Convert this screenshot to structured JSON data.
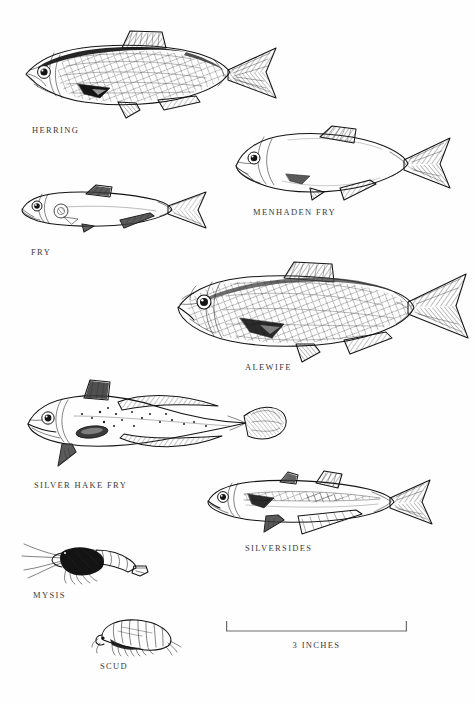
{
  "plate": {
    "title": "Baitfish identification plate",
    "background_color": "#ffffff",
    "ink_color": "#141414",
    "text_color": "#3a3a3a"
  },
  "figures": [
    {
      "id": "herring",
      "label": "HERRING",
      "kind": "fish-illustration",
      "label_x": 32,
      "label_y": 125
    },
    {
      "id": "menhaden-fry",
      "label": "MENHADEN FRY",
      "kind": "fish-illustration",
      "label_x": 253,
      "label_y": 207
    },
    {
      "id": "fry",
      "label": "FRY",
      "kind": "fish-illustration",
      "label_x": 31,
      "label_y": 247
    },
    {
      "id": "alewife",
      "label": "ALEWIFE",
      "kind": "fish-illustration",
      "label_x": 245,
      "label_y": 362
    },
    {
      "id": "silver-hake-fry",
      "label": "SILVER HAKE FRY",
      "kind": "fish-illustration",
      "label_x": 34,
      "label_y": 480
    },
    {
      "id": "silversides",
      "label": "SILVERSIDES",
      "kind": "fish-illustration",
      "label_x": 245,
      "label_y": 543
    },
    {
      "id": "mysis",
      "label": "MYSIS",
      "kind": "shrimp-illustration",
      "label_x": 33,
      "label_y": 590
    },
    {
      "id": "scud",
      "label": "SCUD",
      "kind": "amphipod-illustration",
      "label_x": 100,
      "label_y": 661
    }
  ],
  "scale_bar": {
    "label": "3 INCHES",
    "left_x": 226,
    "right_x": 407,
    "baseline_y": 631,
    "tick_height": 10,
    "label_y": 643
  }
}
